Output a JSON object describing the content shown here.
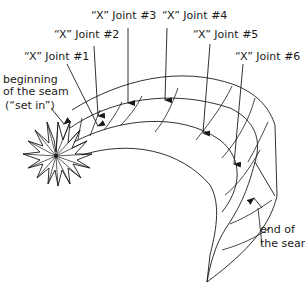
{
  "diagram": {
    "type": "seam-diagram",
    "labels": {
      "joint1": "“X” Joint #1",
      "joint2": "“X” Joint #2",
      "joint3": "“X” Joint #3",
      "joint4": "“X” Joint #4",
      "joint5": "“X” Joint #5",
      "joint6": "“X” Joint #6",
      "beginning_line1": "beginning",
      "beginning_line2": "of the seam",
      "beginning_line3": "(“set in”)",
      "end_line1": "end of",
      "end_line2": "the seam"
    },
    "colors": {
      "ink": "#1a1a1a",
      "background": "#ffffff"
    }
  }
}
